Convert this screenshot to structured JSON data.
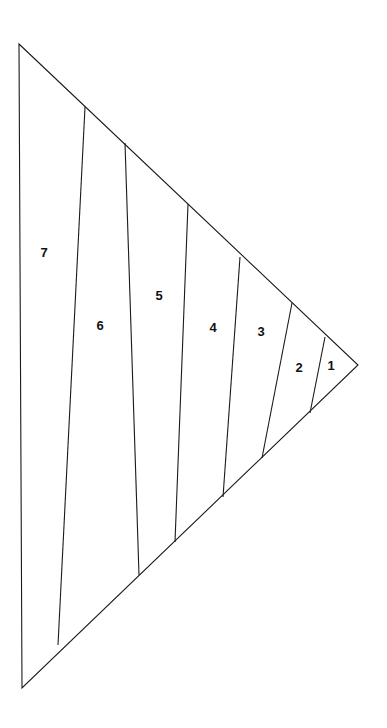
{
  "figure": {
    "canvas": {
      "width": 387,
      "height": 728,
      "background": "#ffffff"
    },
    "stroke_color": "#1a1a1a",
    "stroke_width": 1.1,
    "fill_color": "#ffffff",
    "label_color": "#111111",
    "outline": {
      "name": "triangle-outline",
      "points": "19,44 358,365 22,688",
      "vertices": [
        {
          "name": "top-left-vertex",
          "x": 19,
          "y": 44
        },
        {
          "name": "right-apex-vertex",
          "x": 358,
          "y": 365
        },
        {
          "name": "bottom-left-vertex",
          "x": 22,
          "y": 688
        }
      ]
    },
    "dividers": [
      {
        "id": "divider-7-6",
        "between": "7|6",
        "x1": 85,
        "y1": 107,
        "x2": 58,
        "y2": 645
      },
      {
        "id": "divider-6-5",
        "between": "6|5",
        "x1": 125,
        "y1": 143,
        "x2": 139,
        "y2": 575
      },
      {
        "id": "divider-5-4",
        "between": "5|4",
        "x1": 188,
        "y1": 204,
        "x2": 175,
        "y2": 542
      },
      {
        "id": "divider-4-3",
        "between": "4|3",
        "x1": 240,
        "y1": 257,
        "x2": 223,
        "y2": 497
      },
      {
        "id": "divider-3-2",
        "between": "3|2",
        "x1": 292,
        "y1": 303,
        "x2": 262,
        "y2": 458
      },
      {
        "id": "divider-2-1",
        "between": "2|1",
        "x1": 325,
        "y1": 337,
        "x2": 310,
        "y2": 413
      }
    ],
    "regions": [
      {
        "id": "region-7",
        "label": "7",
        "label_x": 44,
        "label_y": 252,
        "polygon": "19,44 85,107 58,645 22,688"
      },
      {
        "id": "region-6",
        "label": "6",
        "label_x": 100,
        "label_y": 325,
        "polygon": "85,107 125,143 139,575 58,645"
      },
      {
        "id": "region-5",
        "label": "5",
        "label_x": 159,
        "label_y": 295,
        "polygon": "125,143 188,204 175,542 139,575"
      },
      {
        "id": "region-4",
        "label": "4",
        "label_x": 213,
        "label_y": 327,
        "polygon": "188,204 240,257 223,497 175,542"
      },
      {
        "id": "region-3",
        "label": "3",
        "label_x": 261,
        "label_y": 331,
        "polygon": "240,257 292,303 262,458 223,497"
      },
      {
        "id": "region-2",
        "label": "2",
        "label_x": 299,
        "label_y": 367,
        "polygon": "292,303 325,337 310,413 262,458"
      },
      {
        "id": "region-1",
        "label": "1",
        "label_x": 331,
        "label_y": 365,
        "polygon": "325,337 358,365 310,413"
      }
    ]
  }
}
